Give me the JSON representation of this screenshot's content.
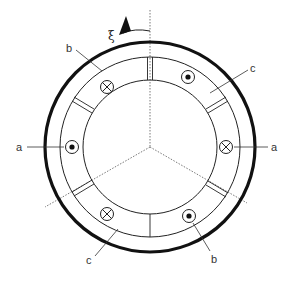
{
  "diagram": {
    "type": "three-phase stator winding cross-section",
    "rotation_label": "ξ",
    "labels": {
      "a_left": "a",
      "a_right": "a",
      "b_top": "b",
      "b_bottom": "b",
      "c_top": "c",
      "c_bottom": "c"
    },
    "conductors": [
      {
        "id": "b-top-left",
        "symbol": "cross",
        "meaning": "current into page"
      },
      {
        "id": "c-top-right",
        "symbol": "dot",
        "meaning": "current out of page"
      },
      {
        "id": "a-left",
        "symbol": "dot",
        "meaning": "current out of page"
      },
      {
        "id": "a-right",
        "symbol": "cross",
        "meaning": "current into page"
      },
      {
        "id": "c-bottom-left",
        "symbol": "cross",
        "meaning": "current into page"
      },
      {
        "id": "b-bottom-right",
        "symbol": "dot",
        "meaning": "current out of page"
      }
    ],
    "colors": {
      "line": "#1a1a1a",
      "background": "#ffffff",
      "label": "#333333"
    }
  }
}
